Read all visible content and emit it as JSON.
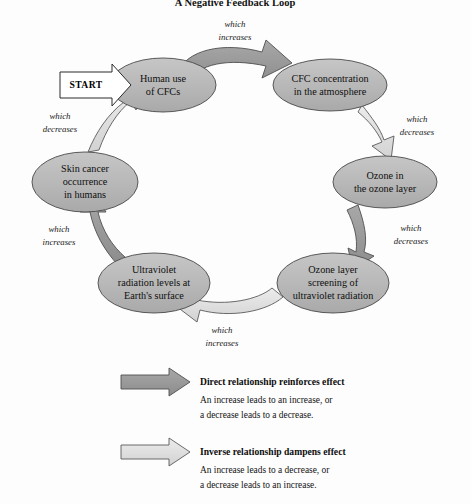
{
  "title": "A Negative Feedback Loop",
  "start_badge": {
    "label": "START"
  },
  "colors": {
    "ellipse_fill": "#b9b9b9",
    "ellipse_stroke": "#4a4a4a",
    "direct_arrow_fill": "#9a9a9a",
    "inverse_arrow_fill": "#dcdcdc",
    "arrow_stroke": "#4f4f4f",
    "background": "#fdfdfd",
    "text": "#111111"
  },
  "nodes": [
    {
      "id": "human-use",
      "lines": [
        "Human use",
        "of CFCs"
      ]
    },
    {
      "id": "cfc-concentration",
      "lines": [
        "CFC concentration",
        "in the atmosphere"
      ]
    },
    {
      "id": "ozone-layer",
      "lines": [
        "Ozone in",
        "the ozone layer"
      ]
    },
    {
      "id": "ozone-screening",
      "lines": [
        "Ozone layer",
        "screening of",
        "ultraviolet radiation"
      ]
    },
    {
      "id": "uv-radiation",
      "lines": [
        "Ultraviolet",
        "radiation levels at",
        "Earth's surface"
      ]
    },
    {
      "id": "skin-cancer",
      "lines": [
        "Skin cancer",
        "occurrence",
        "in humans"
      ]
    }
  ],
  "edges": [
    {
      "id": "human-use-to-cfc",
      "from": "human-use",
      "to": "cfc-concentration",
      "lines": [
        "which",
        "increases"
      ],
      "relationship": "direct"
    },
    {
      "id": "cfc-to-ozone",
      "from": "cfc-concentration",
      "to": "ozone-layer",
      "lines": [
        "which",
        "decreases"
      ],
      "relationship": "inverse"
    },
    {
      "id": "ozone-to-screening",
      "from": "ozone-layer",
      "to": "ozone-screening",
      "lines": [
        "which",
        "decreases"
      ],
      "relationship": "direct"
    },
    {
      "id": "screening-to-uv",
      "from": "ozone-screening",
      "to": "uv-radiation",
      "lines": [
        "which",
        "increases"
      ],
      "relationship": "inverse"
    },
    {
      "id": "uv-to-skin-cancer",
      "from": "uv-radiation",
      "to": "skin-cancer",
      "lines": [
        "which",
        "increases"
      ],
      "relationship": "direct"
    },
    {
      "id": "skin-cancer-to-human-use",
      "from": "skin-cancer",
      "to": "human-use",
      "lines": [
        "which",
        "decreases"
      ],
      "relationship": "inverse"
    }
  ],
  "legend": [
    {
      "id": "direct",
      "title": "Direct relationship reinforces effect",
      "desc_lines": [
        "An increase leads to an increase, or",
        "a decrease leads to a decrease."
      ]
    },
    {
      "id": "inverse",
      "title": "Inverse relationship dampens effect",
      "desc_lines": [
        "An increase leads to a decrease, or",
        "a decrease leads to an increase."
      ]
    }
  ]
}
